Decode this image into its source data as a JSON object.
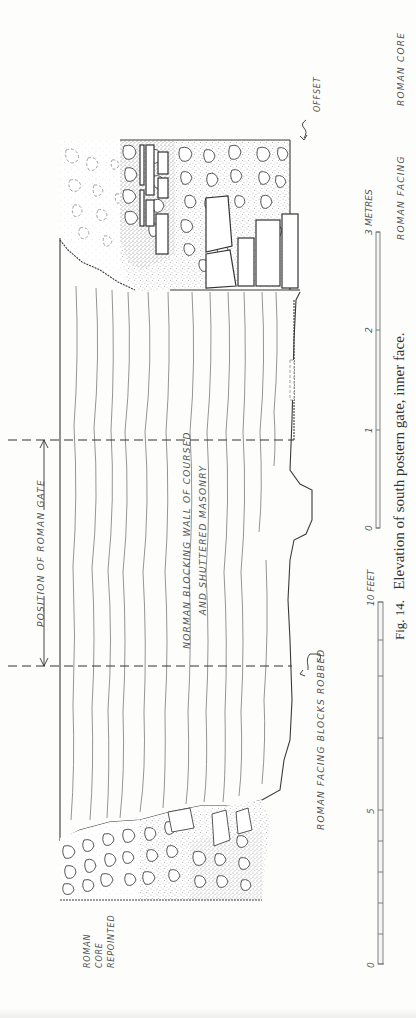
{
  "figure": {
    "caption_prefix": "Fig. 14.",
    "caption_text": "Elevation of south postern gate, inner face.",
    "orientation": "rotated 90° counter-clockwise"
  },
  "labels": {
    "roman_core": "ROMAN CORE",
    "roman_facing": "ROMAN FACING",
    "offset": "OFFSET",
    "position_of_roman_gate": "POSITION OF ROMAN GATE",
    "norman_wall_line1": "NORMAN BLOCKING WALL OF COURSED",
    "norman_wall_line2": "AND SHUTTERED MASONRY",
    "roman_facing_blocks_robbed": "ROMAN FACING BLOCKS ROBBED",
    "roman_core_repointed_line1": "ROMAN",
    "roman_core_repointed_line2": "CORE",
    "roman_core_repointed_line3": "REPOINTED"
  },
  "scales": {
    "metres": {
      "unit_label": "METRES",
      "ticks": [
        "0",
        "1",
        "2",
        "3"
      ]
    },
    "feet": {
      "unit_label": "FEET",
      "ticks": [
        "0",
        "5",
        "10"
      ],
      "end_label": "10 FEET"
    }
  },
  "colors": {
    "ink": "#333333",
    "faint_ink": "#7a7a7a",
    "paper": "#fdfdfc"
  }
}
